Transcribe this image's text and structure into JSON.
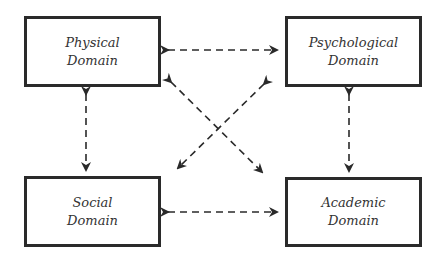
{
  "diagram": {
    "nodes": [
      {
        "id": "physical",
        "line1": "Physical",
        "line2": "Domain"
      },
      {
        "id": "psychological",
        "line1": "Psychological",
        "line2": "Domain"
      },
      {
        "id": "social",
        "line1": "Social",
        "line2": "Domain"
      },
      {
        "id": "academic",
        "line1": "Academic",
        "line2": "Domain"
      }
    ],
    "edges": [
      {
        "from": "physical",
        "to": "psychological",
        "style": "dashed",
        "direction": "bidirectional"
      },
      {
        "from": "physical",
        "to": "social",
        "style": "dashed",
        "direction": "bidirectional"
      },
      {
        "from": "psychological",
        "to": "academic",
        "style": "dashed",
        "direction": "bidirectional"
      },
      {
        "from": "social",
        "to": "academic",
        "style": "dashed",
        "direction": "bidirectional"
      },
      {
        "from": "physical",
        "to": "academic",
        "style": "dashed",
        "direction": "bidirectional"
      },
      {
        "from": "psychological",
        "to": "social",
        "style": "dashed",
        "direction": "bidirectional"
      }
    ],
    "colors": {
      "stroke": "#2a2a2a",
      "text": "#333333",
      "background": "#ffffff"
    }
  }
}
